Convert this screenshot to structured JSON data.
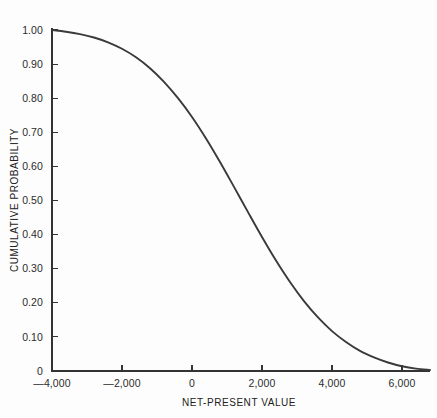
{
  "chart_data": {
    "type": "line",
    "title": "",
    "subtitle": "",
    "xlabel": "NET-PRESENT VALUE",
    "ylabel": "CUMULATIVE PROBABILITY",
    "xlim": [
      -4000,
      6800
    ],
    "ylim": [
      0,
      1.0
    ],
    "grid": false,
    "legend": false,
    "legend_position": "none",
    "annotations": [],
    "xticks": [
      -4000,
      -2000,
      0,
      2000,
      4000,
      6000
    ],
    "xtick_labels": [
      "—4,000",
      "—2,000",
      "0",
      "2,000",
      "4,000",
      "6,000"
    ],
    "yticks": [
      0,
      0.1,
      0.2,
      0.3,
      0.4,
      0.5,
      0.6,
      0.7,
      0.8,
      0.9,
      1.0
    ],
    "ytick_labels": [
      "0",
      "0.10",
      "0.20",
      "0.30",
      "0.40",
      "0.50",
      "0.60",
      "0.70",
      "0.80",
      "0.90",
      "1.00"
    ],
    "series": [
      {
        "name": "Cumulative probability",
        "color": "#3a3a3a",
        "x": [
          -4000,
          -3600,
          -3200,
          -2800,
          -2400,
          -2000,
          -1600,
          -1200,
          -800,
          -400,
          0,
          400,
          800,
          1200,
          1600,
          2000,
          2400,
          2800,
          3200,
          3600,
          4000,
          4400,
          4800,
          5200,
          5600,
          6000,
          6400,
          6800
        ],
        "y": [
          1.0,
          0.995,
          0.988,
          0.978,
          0.964,
          0.945,
          0.92,
          0.888,
          0.848,
          0.8,
          0.745,
          0.682,
          0.613,
          0.54,
          0.466,
          0.393,
          0.324,
          0.261,
          0.205,
          0.157,
          0.117,
          0.085,
          0.059,
          0.04,
          0.025,
          0.014,
          0.007,
          0.003
        ]
      }
    ]
  },
  "colors": {
    "background": "#fdfdfd",
    "curve": "#3a3a3a",
    "axis": "#333333",
    "text": "#2b2b2b"
  }
}
